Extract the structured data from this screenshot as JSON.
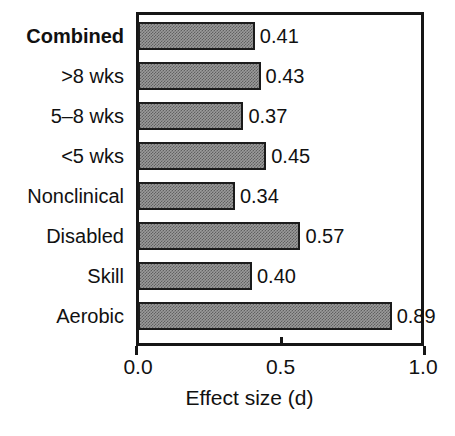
{
  "chart_data": {
    "type": "bar",
    "orientation": "horizontal",
    "title": "",
    "xlabel": "Effect size (d)",
    "ylabel": "",
    "xlim": [
      0.0,
      1.0
    ],
    "xticks": [
      "0.0",
      "0.5",
      "1.0"
    ],
    "xtick_values": [
      0.0,
      0.5,
      1.0
    ],
    "grid": false,
    "legend": null,
    "bar_fill_color": "#9b9b9b",
    "bar_edge_color": "#1b1b1b",
    "axis_color": "#161616",
    "categories": [
      "Combined",
      ">8 wks",
      "5–8 wks",
      "<5 wks",
      "Nonclinical",
      "Disabled",
      "Skill",
      "Aerobic"
    ],
    "values": [
      0.41,
      0.43,
      0.37,
      0.45,
      0.34,
      0.57,
      0.4,
      0.89
    ],
    "value_labels": [
      "0.41",
      "0.43",
      "0.37",
      "0.45",
      "0.34",
      "0.57",
      "0.40",
      "0.89"
    ],
    "emphasized_categories": [
      "Combined"
    ],
    "bars": [
      {
        "label": "Combined",
        "value": 0.41,
        "value_label": "0.41",
        "bold": true
      },
      {
        "label": ">8 wks",
        "value": 0.43,
        "value_label": "0.43",
        "bold": false
      },
      {
        "label": "5–8 wks",
        "value": 0.37,
        "value_label": "0.37",
        "bold": false
      },
      {
        "label": "<5 wks",
        "value": 0.45,
        "value_label": "0.45",
        "bold": false
      },
      {
        "label": "Nonclinical",
        "value": 0.34,
        "value_label": "0.34",
        "bold": false
      },
      {
        "label": "Disabled",
        "value": 0.57,
        "value_label": "0.57",
        "bold": false
      },
      {
        "label": "Skill",
        "value": 0.4,
        "value_label": "0.40",
        "bold": false
      },
      {
        "label": "Aerobic",
        "value": 0.89,
        "value_label": "0.89",
        "bold": false
      }
    ]
  }
}
